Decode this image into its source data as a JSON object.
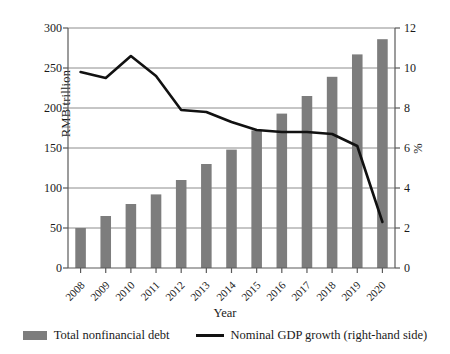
{
  "chart_data": {
    "type": "bar",
    "title": "",
    "xlabel": "Year",
    "ylabel": "RMB trillion",
    "ylabel_right": "%",
    "categories": [
      "2008",
      "2009",
      "2010",
      "2011",
      "2012",
      "2013",
      "2014",
      "2015",
      "2016",
      "2017",
      "2018",
      "2019",
      "2020"
    ],
    "ylim": [
      0,
      300
    ],
    "yticks": [
      "0",
      "50",
      "100",
      "150",
      "200",
      "250",
      "300"
    ],
    "ylim_right": [
      0,
      12
    ],
    "yticks_right": [
      "0",
      "2",
      "4",
      "6",
      "8",
      "10",
      "12"
    ],
    "grid": true,
    "legend_position": "bottom",
    "series": [
      {
        "name": "Total nonfinancial debt",
        "type": "bar",
        "axis": "left",
        "color": "#7d7d7d",
        "values": [
          50,
          65,
          80,
          92,
          110,
          130,
          148,
          172,
          193,
          215,
          239,
          267,
          286
        ]
      },
      {
        "name": "Nominal GDP growth (right-hand side)",
        "type": "line",
        "axis": "right",
        "color": "#111111",
        "values": [
          9.8,
          9.5,
          10.6,
          9.6,
          7.9,
          7.8,
          7.3,
          6.9,
          6.8,
          6.8,
          6.7,
          6.1,
          2.3
        ]
      }
    ]
  },
  "legend": {
    "bar_label": "Total nonfinancial debt",
    "line_label": "Nominal GDP growth (right-hand side)"
  }
}
